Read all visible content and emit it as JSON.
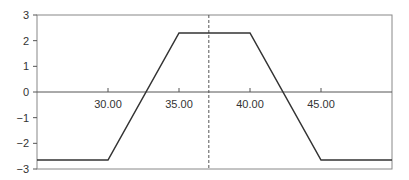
{
  "chart_data": {
    "type": "line",
    "title": "",
    "xlabel": "",
    "ylabel": "",
    "xlim": [
      25,
      50
    ],
    "ylim": [
      -3,
      3
    ],
    "grid": false,
    "legend": null,
    "x_ticks": [
      30,
      35,
      40,
      45
    ],
    "x_tick_labels": [
      "30.00",
      "35.00",
      "40.00",
      "45.00"
    ],
    "y_ticks": [
      3,
      2,
      1,
      0,
      -1,
      -2,
      -3
    ],
    "y_tick_labels": [
      "3",
      "2",
      "1",
      "0",
      "−1",
      "−2",
      "−3"
    ],
    "series": [
      {
        "name": "payoff",
        "color": "#333333",
        "x": [
          25,
          30,
          35,
          40,
          45,
          50
        ],
        "y": [
          -2.65,
          -2.65,
          2.3,
          2.3,
          -2.65,
          -2.65
        ]
      }
    ],
    "annotations": [
      {
        "type": "vertical-dashed-line",
        "x": 37.1,
        "color": "#555555"
      },
      {
        "type": "horizontal-axis-line",
        "y": 0,
        "color": "#555555"
      }
    ]
  }
}
